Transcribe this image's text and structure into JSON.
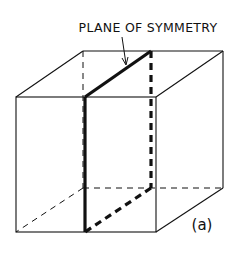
{
  "figure": {
    "title_label": "PLANE OF SYMMETRY",
    "panel_label": "(a)",
    "colors": {
      "background": "#ffffff",
      "ink": "#111111"
    }
  }
}
